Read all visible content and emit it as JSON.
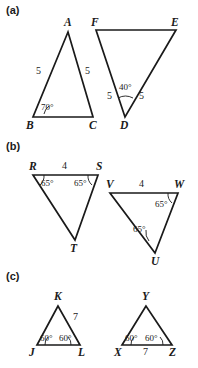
{
  "figure": {
    "background_color": "#ffffff",
    "stroke_color": "#1a1a1a",
    "width": 198,
    "height": 368
  },
  "parts": [
    {
      "label": "(a)",
      "label_x": 6,
      "label_y": 4,
      "triangles": [
        {
          "name": "ABC",
          "points": "68,32 33,117 93,117",
          "vertices": [
            {
              "text": "A",
              "x": 64,
              "y": 17
            },
            {
              "text": "B",
              "x": 26,
              "y": 120
            },
            {
              "text": "C",
              "x": 89,
              "y": 120
            }
          ],
          "sides": [
            {
              "text": "5",
              "x": 36,
              "y": 66
            },
            {
              "text": "5",
              "x": 85,
              "y": 66
            }
          ],
          "angles": [
            {
              "text": "70°",
              "x": 41,
              "y": 103,
              "arc": "M 44,114 A 13,13 0 0 1 49,106"
            }
          ]
        },
        {
          "name": "DEF",
          "points": "96,30 176,30 125,117",
          "vertices": [
            {
              "text": "F",
              "x": 91,
              "y": 17
            },
            {
              "text": "E",
              "x": 171,
              "y": 17
            },
            {
              "text": "D",
              "x": 120,
              "y": 120
            }
          ],
          "sides": [
            {
              "text": "5",
              "x": 107,
              "y": 91
            },
            {
              "text": "5",
              "x": 139,
              "y": 91
            }
          ],
          "angles": [
            {
              "text": "40°",
              "x": 119,
              "y": 83,
              "arc": "M 118,98 A 16,16 0 0 1 133,98"
            }
          ]
        }
      ]
    },
    {
      "label": "(b)",
      "label_x": 6,
      "label_y": 140,
      "triangles": [
        {
          "name": "RST",
          "points": "33,175 98,175 75,240",
          "vertices": [
            {
              "text": "R",
              "x": 29,
              "y": 161
            },
            {
              "text": "S",
              "x": 96,
              "y": 161
            },
            {
              "text": "T",
              "x": 70,
              "y": 243
            }
          ],
          "sides": [
            {
              "text": "4",
              "x": 62,
              "y": 161
            }
          ],
          "angles": [
            {
              "text": "65°",
              "x": 41,
              "y": 179,
              "arc": "M 44,175 A 12,12 0 0 1 40,185"
            },
            {
              "text": "65°",
              "x": 74,
              "y": 179,
              "arc": "M 88,175 A 12,12 0 0 0 92,185"
            }
          ]
        },
        {
          "name": "VWU",
          "points": "110,193 178,193 155,253",
          "vertices": [
            {
              "text": "V",
              "x": 106,
              "y": 179
            },
            {
              "text": "W",
              "x": 174,
              "y": 179
            },
            {
              "text": "U",
              "x": 151,
              "y": 256
            }
          ],
          "sides": [
            {
              "text": "4",
              "x": 139,
              "y": 179
            }
          ],
          "angles": [
            {
              "text": "65°",
              "x": 155,
              "y": 200,
              "arc": "M 168,193 A 12,12 0 0 0 172,203"
            },
            {
              "text": "65°",
              "x": 133,
              "y": 225,
              "arc": "M 149,241 A 14,14 0 0 1 146,230"
            }
          ]
        }
      ]
    },
    {
      "label": "(c)",
      "label_x": 6,
      "label_y": 270,
      "triangles": [
        {
          "name": "JKL",
          "points": "58,306 37,345 80,345",
          "vertices": [
            {
              "text": "K",
              "x": 54,
              "y": 291
            },
            {
              "text": "J",
              "x": 29,
              "y": 347
            },
            {
              "text": "L",
              "x": 78,
              "y": 347
            }
          ],
          "sides": [
            {
              "text": "7",
              "x": 73,
              "y": 312
            }
          ],
          "angles": [
            {
              "text": "60°",
              "x": 40,
              "y": 334,
              "arc": "M 45,345 A 10,10 0 0 1 48,337"
            },
            {
              "text": "60°",
              "x": 59,
              "y": 334,
              "arc": "M 71,345 A 10,10 0 0 0 68,337"
            }
          ]
        },
        {
          "name": "XYZ",
          "points": "146,306 122,345 172,345",
          "vertices": [
            {
              "text": "Y",
              "x": 142,
              "y": 291
            },
            {
              "text": "X",
              "x": 114,
              "y": 347
            },
            {
              "text": "Z",
              "x": 169,
              "y": 347
            }
          ],
          "sides": [
            {
              "text": "7",
              "x": 143,
              "y": 347
            }
          ],
          "angles": [
            {
              "text": "60°",
              "x": 125,
              "y": 334,
              "arc": "M 131,345 A 10,10 0 0 1 134,337"
            },
            {
              "text": "60°",
              "x": 145,
              "y": 334,
              "arc": "M 163,345 A 10,10 0 0 0 160,337"
            }
          ]
        }
      ]
    }
  ]
}
